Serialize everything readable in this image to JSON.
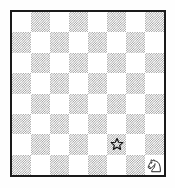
{
  "figure": {
    "name": "chessboard-diagram",
    "background_color": "#fefefe",
    "border_color": "#1a1a1a",
    "light_square_color": "#ffffff",
    "dark_square_color": "#9a9a9a"
  },
  "board": {
    "files": 8,
    "ranks": 8,
    "top_left_square": "light",
    "rows": [
      [
        "light",
        "dark",
        "light",
        "dark",
        "light",
        "dark",
        "light",
        "dark"
      ],
      [
        "dark",
        "light",
        "dark",
        "light",
        "dark",
        "light",
        "dark",
        "light"
      ],
      [
        "light",
        "dark",
        "light",
        "dark",
        "light",
        "dark",
        "light",
        "dark"
      ],
      [
        "dark",
        "light",
        "dark",
        "light",
        "dark",
        "light",
        "dark",
        "light"
      ],
      [
        "light",
        "dark",
        "light",
        "dark",
        "light",
        "dark",
        "light",
        "dark"
      ],
      [
        "dark",
        "light",
        "dark",
        "light",
        "dark",
        "light",
        "dark",
        "light"
      ],
      [
        "light",
        "dark",
        "light",
        "dark",
        "light",
        "dark",
        "light",
        "dark"
      ],
      [
        "dark",
        "light",
        "dark",
        "light",
        "dark",
        "light",
        "dark",
        "light"
      ]
    ],
    "markers": [
      {
        "symbol": "star-outline",
        "glyph": "☆",
        "label": "star",
        "row": 6,
        "col": 5,
        "square_shade": "light"
      }
    ],
    "pieces": [
      {
        "symbol": "white-knight",
        "glyph": "♘",
        "label": "knight",
        "color": "white",
        "row": 7,
        "col": 7,
        "square_shade": "light",
        "facing": "left"
      }
    ]
  }
}
